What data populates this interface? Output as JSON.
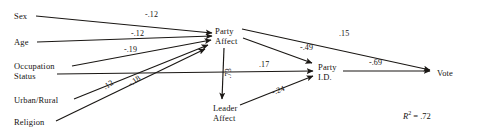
{
  "diagram": {
    "type": "path-diagram",
    "title": "",
    "fit_statistic": {
      "symbol": "R",
      "exponent": "2",
      "equals": "= .72",
      "value": 0.72
    },
    "nodes": [
      {
        "id": "sex",
        "label_line1": "Sex",
        "label_line2": "",
        "x": 14,
        "y": 11
      },
      {
        "id": "age",
        "label_line1": "Age",
        "label_line2": "",
        "x": 14,
        "y": 37
      },
      {
        "id": "occupation",
        "label_line1": "Occupation",
        "label_line2": "Status",
        "x": 14,
        "y": 61
      },
      {
        "id": "urban",
        "label_line1": "Urban/Rural",
        "label_line2": "",
        "x": 14,
        "y": 95
      },
      {
        "id": "religion",
        "label_line1": "Religion",
        "label_line2": "",
        "x": 14,
        "y": 117
      },
      {
        "id": "party-affect",
        "label_line1": "Party",
        "label_line2": "Affect",
        "x": 215,
        "y": 26
      },
      {
        "id": "leader-affect",
        "label_line1": "Leader",
        "label_line2": "Affect",
        "x": 213,
        "y": 103
      },
      {
        "id": "party-id",
        "label_line1": "Party",
        "label_line2": "I.D.",
        "x": 318,
        "y": 62
      },
      {
        "id": "vote",
        "label_line1": "Vote",
        "label_line2": "",
        "x": 437,
        "y": 68
      }
    ],
    "edges": [
      {
        "id": "sex-to-party-affect",
        "from": "sex",
        "to": "party-affect",
        "coefficient": "-.12",
        "value": -0.12,
        "label_x": 145,
        "label_y": 10,
        "rotation": 0
      },
      {
        "id": "age-to-party-affect",
        "from": "age",
        "to": "party-affect",
        "coefficient": "-.12",
        "value": -0.12,
        "label_x": 131,
        "label_y": 29,
        "rotation": 0
      },
      {
        "id": "occupation-to-party-affect",
        "from": "occupation",
        "to": "party-affect",
        "coefficient": "-.19",
        "value": -0.19,
        "label_x": 124,
        "label_y": 45,
        "rotation": 0
      },
      {
        "id": "urban-to-party-affect",
        "from": "urban",
        "to": "party-affect",
        "coefficient": ".12",
        "value": 0.12,
        "label_x": 104,
        "label_y": 83,
        "rotation": -32
      },
      {
        "id": "religion-to-party-affect",
        "from": "religion",
        "to": "party-affect",
        "coefficient": "-.18",
        "value": -0.18,
        "label_x": 129,
        "label_y": 80,
        "rotation": -35
      },
      {
        "id": "occupation-to-party-id",
        "from": "occupation",
        "to": "party-id",
        "coefficient": ".17",
        "value": 0.17,
        "label_x": 259,
        "label_y": 60,
        "rotation": 0
      },
      {
        "id": "party-affect-to-vote",
        "from": "party-affect",
        "to": "vote",
        "coefficient": ".15",
        "value": 0.15,
        "label_x": 339,
        "label_y": 29,
        "rotation": 0
      },
      {
        "id": "party-affect-to-party-id",
        "from": "party-affect",
        "to": "party-id",
        "coefficient": "-.49",
        "value": -0.49,
        "label_x": 300,
        "label_y": 43,
        "rotation": 0
      },
      {
        "id": "party-affect-to-leader-affect",
        "from": "party-affect",
        "to": "leader-affect",
        "coefficient": ".73",
        "value": 0.73,
        "label_x": 228,
        "label_y": 74,
        "rotation": -90
      },
      {
        "id": "leader-affect-to-party-id",
        "from": "leader-affect",
        "to": "party-id",
        "coefficient": "-.24",
        "value": -0.24,
        "label_x": 272,
        "label_y": 88,
        "rotation": -20
      },
      {
        "id": "party-id-to-vote",
        "from": "party-id",
        "to": "vote",
        "coefficient": "-.69",
        "value": -0.69,
        "label_x": 369,
        "label_y": 58,
        "rotation": 0
      }
    ],
    "colors": {
      "line": "#1a1714",
      "text": "#15120f",
      "background": "#ffffff"
    }
  }
}
